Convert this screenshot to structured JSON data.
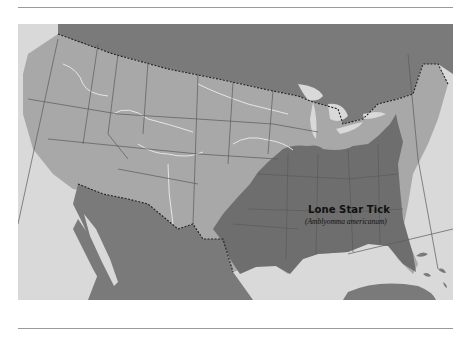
{
  "figure": {
    "type": "range-map",
    "region": "United States and Mexico",
    "label": {
      "title": "Lone Star Tick",
      "subtitle": "(Amblyomma americanum)"
    },
    "colors": {
      "water": "#d9d9d9",
      "land_foreign": "#7a7a7a",
      "land_us": "#a8a8a8",
      "range": "#6e6e6e",
      "state_lines": "#5a5a5a",
      "rivers": "#e6e6e6",
      "border": "#222222"
    }
  }
}
